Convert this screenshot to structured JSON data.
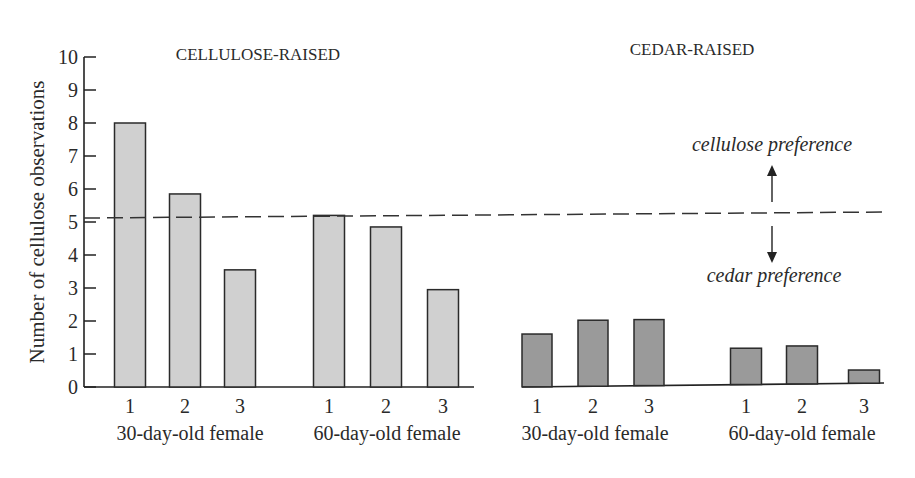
{
  "chart_data": {
    "type": "bar",
    "title": "",
    "ylabel": "Number of cellulose observations",
    "xlabel": "",
    "ylim": [
      0,
      10
    ],
    "yticks": [
      0,
      1,
      2,
      3,
      4,
      5,
      6,
      7,
      8,
      9,
      10
    ],
    "grid": false,
    "reference_line": {
      "y": 5,
      "style": "dashed"
    },
    "annotations": [
      {
        "text": "cellulose preference",
        "arrow": "up"
      },
      {
        "text": "cedar preference",
        "arrow": "down"
      }
    ],
    "panels": [
      {
        "title": "CELLULOSE-RAISED",
        "color": "#d0d0d0",
        "groups": [
          {
            "label": "30-day-old female",
            "categories": [
              "1",
              "2",
              "3"
            ],
            "values": [
              8.0,
              5.85,
              3.55
            ]
          },
          {
            "label": "60-day-old female",
            "categories": [
              "1",
              "2",
              "3"
            ],
            "values": [
              5.2,
              4.85,
              2.95
            ]
          }
        ]
      },
      {
        "title": "CEDAR-RAISED",
        "color": "#9a9a9a",
        "groups": [
          {
            "label": "30-day-old female",
            "categories": [
              "1",
              "2",
              "3"
            ],
            "values": [
              1.6,
              2.0,
              2.0
            ]
          },
          {
            "label": "60-day-old female",
            "categories": [
              "1",
              "2",
              "3"
            ],
            "values": [
              1.1,
              1.15,
              0.4
            ]
          }
        ]
      }
    ]
  },
  "labels": {
    "panel_left_title": "CELLULOSE-RAISED",
    "panel_right_title": "CEDAR-RAISED",
    "ylabel": "Number of cellulose observations",
    "up_annotation": "cellulose preference",
    "down_annotation": "cedar preference"
  }
}
